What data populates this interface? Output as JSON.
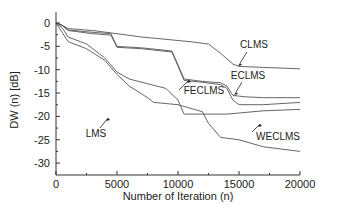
{
  "chart_data": {
    "type": "line",
    "title": "",
    "xlabel": "Number of Iteration (n)",
    "ylabel": "DW (n) [dB]",
    "xlim": [
      0,
      20000
    ],
    "ylim": [
      -32.5,
      2.5
    ],
    "grid": false,
    "legend": "inline annotations",
    "x_ticks": [
      "0",
      "5000",
      "10000",
      "15000",
      "20000"
    ],
    "y_ticks": [
      "0",
      "-5",
      "-10",
      "-15",
      "-20",
      "-25",
      "-30"
    ],
    "series": [
      {
        "name": "CLMS",
        "x": [
          0,
          500,
          1000,
          3000,
          5000,
          7000,
          9000,
          11000,
          12500,
          13500,
          14500,
          15000,
          17000,
          20000
        ],
        "values": [
          0,
          -0.5,
          -1.2,
          -1.6,
          -2.3,
          -3.0,
          -3.5,
          -4.0,
          -4.5,
          -6.5,
          -8.8,
          -9.3,
          -9.5,
          -9.8
        ]
      },
      {
        "name": "ECLMS",
        "x": [
          0,
          500,
          1000,
          3000,
          4500,
          5000,
          7000,
          9500,
          10000,
          10500,
          12000,
          13500,
          14000,
          14500,
          15500,
          17000,
          20000
        ],
        "values": [
          0,
          -0.5,
          -1.5,
          -2.0,
          -2.3,
          -5.0,
          -5.3,
          -6.0,
          -9.0,
          -12.0,
          -12.5,
          -12.8,
          -13.5,
          -15.5,
          -15.8,
          -16.0,
          -16.0
        ]
      },
      {
        "name": "FECLMS",
        "x": [
          0,
          500,
          1000,
          3000,
          4500,
          5000,
          7000,
          9500,
          10000,
          10500,
          12000,
          13500,
          14000,
          14500,
          15000,
          17000,
          20000
        ],
        "values": [
          0,
          -0.5,
          -1.6,
          -2.3,
          -2.6,
          -5.2,
          -5.5,
          -6.2,
          -9.2,
          -12.3,
          -12.7,
          -13.2,
          -14.0,
          -16.5,
          -17.5,
          -17.5,
          -17.0
        ]
      },
      {
        "name": "WECLMS",
        "x": [
          0,
          500,
          1000,
          2500,
          4000,
          5000,
          6000,
          7500,
          9000,
          10000,
          10500,
          14000,
          17000,
          20000
        ],
        "values": [
          0,
          -1.0,
          -3.0,
          -4.5,
          -7.5,
          -10.5,
          -12.0,
          -13.0,
          -14.0,
          -16.5,
          -19.5,
          -19.5,
          -18.8,
          -18.5
        ]
      },
      {
        "name": "LMS",
        "x": [
          0,
          500,
          1000,
          2500,
          4000,
          5000,
          6000,
          7500,
          8000,
          10000,
          12000,
          12500,
          13500,
          15000,
          17000,
          20000
        ],
        "values": [
          0,
          -2.0,
          -4.0,
          -5.5,
          -8.0,
          -11.0,
          -13.5,
          -16.0,
          -17.0,
          -17.5,
          -19.0,
          -21.5,
          -24.5,
          -25.0,
          -26.5,
          -27.5
        ]
      }
    ],
    "annotations": [
      {
        "text": "CLMS",
        "target_series": "CLMS"
      },
      {
        "text": "ECLMS",
        "target_series": "ECLMS"
      },
      {
        "text": "FECLMS",
        "target_series": "FECLMS"
      },
      {
        "text": "WECLMS",
        "target_series": "WECLMS"
      },
      {
        "text": "LMS",
        "target_series": "LMS"
      }
    ]
  },
  "style": {
    "line_color": "#555555",
    "axis_color": "#333333",
    "text_color": "#222222"
  }
}
